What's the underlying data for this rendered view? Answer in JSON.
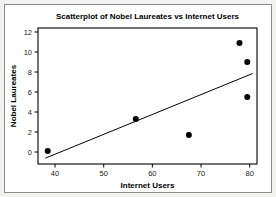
{
  "figure": {
    "background_color": "#f2f2f0",
    "panel_color": "#ffffff",
    "border_color": "#8c8c8c"
  },
  "chart_data": {
    "type": "scatter",
    "title": "Scatterplot of Nobel Laureates vs Internet Users",
    "xlabel": "Internet Users",
    "ylabel": "Nobel Laureates",
    "xlim": [
      36.5,
      81.5
    ],
    "ylim": [
      -1.2,
      12.4
    ],
    "xticks": [
      40,
      50,
      60,
      70,
      80
    ],
    "xtick_labels": [
      "40",
      "50",
      "60",
      "70",
      "80"
    ],
    "yticks": [
      0,
      2,
      4,
      6,
      8,
      10,
      12
    ],
    "ytick_labels": [
      "0",
      "2",
      "4",
      "6",
      "8",
      "10",
      "12"
    ],
    "grid": false,
    "legend": null,
    "marker_color": "#000000",
    "marker_size": 4.2,
    "line_color": "#000000",
    "points": [
      {
        "x": 38.5,
        "y": 0.1
      },
      {
        "x": 56.6,
        "y": 3.3
      },
      {
        "x": 67.5,
        "y": 1.7
      },
      {
        "x": 77.9,
        "y": 10.9
      },
      {
        "x": 79.5,
        "y": 9.0
      },
      {
        "x": 79.5,
        "y": 5.5
      }
    ],
    "fit_line": {
      "type": "linear-regression",
      "x_start": 38.0,
      "y_start": -0.62,
      "x_end": 80.6,
      "y_end": 7.85
    }
  }
}
